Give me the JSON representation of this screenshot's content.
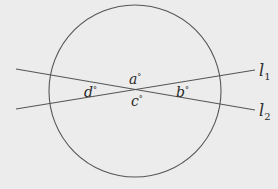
{
  "diagram": {
    "type": "geometry",
    "colors": {
      "background": "#ececec",
      "stroke": "#555555",
      "text": "#2a2a2a"
    },
    "circle": {
      "cx": 135,
      "cy": 91,
      "r": 86
    },
    "intersection": {
      "x": 136,
      "y": 88
    },
    "lines": [
      {
        "id": "l1",
        "label": "l",
        "subscript": "1",
        "x1": 16,
        "y1": 109,
        "x2": 255,
        "y2": 70
      },
      {
        "id": "l2",
        "label": "l",
        "subscript": "2",
        "x1": 16,
        "y1": 69,
        "x2": 255,
        "y2": 110
      }
    ],
    "angles": [
      {
        "id": "a",
        "label": "a",
        "unit": "°",
        "position": "top"
      },
      {
        "id": "b",
        "label": "b",
        "unit": "°",
        "position": "right"
      },
      {
        "id": "c",
        "label": "c",
        "unit": "°",
        "position": "bottom"
      },
      {
        "id": "d",
        "label": "d",
        "unit": "°",
        "position": "left"
      }
    ]
  }
}
